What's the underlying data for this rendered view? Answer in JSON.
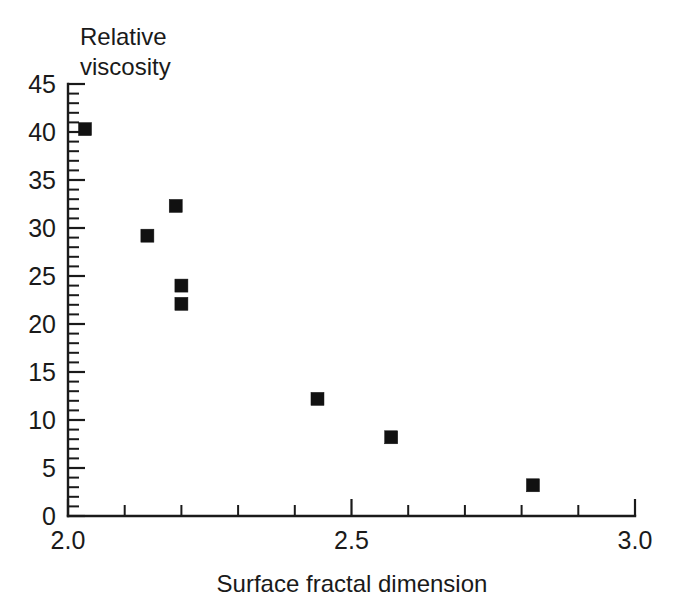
{
  "chart_data": {
    "type": "scatter",
    "title": "",
    "ylabel_line1": "Relative",
    "ylabel_line2": "viscosity",
    "xlabel": "Surface fractal dimension",
    "ylabel": "Relative viscosity",
    "xlim": [
      2.0,
      3.0
    ],
    "ylim": [
      0,
      45
    ],
    "grid": false,
    "legend": "none",
    "x_major_ticks": [
      2.0,
      2.5,
      3.0
    ],
    "x_major_tick_labels": [
      "2.0",
      "2.5",
      "3.0"
    ],
    "x_minor_tick_step": 0.1,
    "y_major_ticks": [
      0,
      5,
      10,
      15,
      20,
      25,
      30,
      35,
      40,
      45
    ],
    "y_major_tick_labels": [
      "0",
      "5",
      "10",
      "15",
      "20",
      "25",
      "30",
      "35",
      "40",
      "45"
    ],
    "y_minor_tick_step": 1,
    "marker": "filled-square",
    "marker_color": "#111111",
    "series": [
      {
        "name": "Relative viscosity vs surface fractal dimension",
        "points": [
          {
            "x": 2.03,
            "y": 40.3
          },
          {
            "x": 2.14,
            "y": 29.2
          },
          {
            "x": 2.19,
            "y": 32.3
          },
          {
            "x": 2.2,
            "y": 24.0
          },
          {
            "x": 2.2,
            "y": 22.1
          },
          {
            "x": 2.44,
            "y": 12.2
          },
          {
            "x": 2.57,
            "y": 8.2
          },
          {
            "x": 2.82,
            "y": 3.2
          }
        ]
      }
    ]
  },
  "labels": {
    "y_axis_title_line1": "Relative",
    "y_axis_title_line2": "viscosity",
    "x_axis_title": "Surface fractal dimension"
  }
}
